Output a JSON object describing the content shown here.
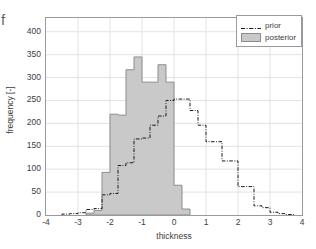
{
  "figure": {
    "stray_glyph": "f",
    "background_color": "#ffffff",
    "frame_color": "#9a9a9a",
    "grid_color": "#e3e3e3"
  },
  "legend": {
    "position": "top-right",
    "entries": [
      {
        "label": "prior",
        "key": "dashdot-line",
        "color": "#1a1a1a"
      },
      {
        "label": "posterior",
        "key": "filled-patch",
        "color": "#c9c9c9"
      }
    ]
  },
  "chart_data": {
    "type": "bar",
    "title": "",
    "subtitle": "",
    "xlabel": "thickness",
    "ylabel": "frequency [-]",
    "xlim": [
      -4,
      4
    ],
    "ylim": [
      0,
      430
    ],
    "xticks": [
      -4,
      -3,
      -2,
      -1,
      0,
      1,
      2,
      3,
      4
    ],
    "xticklabels": [
      "-4",
      "-3",
      "-2",
      "-1",
      "0",
      "1",
      "2",
      "3",
      "4"
    ],
    "yticks": [
      0,
      50,
      100,
      150,
      200,
      250,
      300,
      350,
      400
    ],
    "yticklabels": [
      "0",
      "50",
      "100",
      "150",
      "200",
      "250",
      "300",
      "350",
      "400"
    ],
    "grid": true,
    "legend_position": "upper right",
    "annotations": [],
    "series": [
      {
        "name": "posterior",
        "type": "histogram",
        "draw": "filled-bars",
        "fill_color": "#c9c9c9",
        "edge_color": "#8d8d8d",
        "bin_width": 0.25,
        "bin_left_edges": [
          -2.75,
          -2.5,
          -2.25,
          -2.0,
          -1.75,
          -1.5,
          -1.25,
          -1.0,
          -0.75,
          -0.5,
          -0.25,
          0.0,
          0.25
        ],
        "values": [
          4,
          10,
          93,
          220,
          218,
          317,
          345,
          290,
          290,
          328,
          290,
          65,
          13
        ]
      },
      {
        "name": "prior",
        "type": "histogram",
        "draw": "dashdot-step-line",
        "line_color": "#1a1a1a",
        "line_style": "dash-dot",
        "line_width": 1,
        "bin_width": 0.25,
        "bin_left_edges": [
          -3.5,
          -3.25,
          -3.0,
          -2.75,
          -2.5,
          -2.25,
          -2.0,
          -1.75,
          -1.5,
          -1.25,
          -1.0,
          -0.75,
          -0.5,
          -0.25,
          0.0,
          0.25,
          0.5,
          0.75,
          1.0,
          1.25,
          1.5,
          1.75,
          2.0,
          2.25,
          2.5,
          2.75,
          3.0,
          3.25,
          3.5
        ],
        "values": [
          2,
          3,
          5,
          12,
          14,
          44,
          47,
          108,
          114,
          166,
          168,
          196,
          216,
          250,
          253,
          253,
          228,
          196,
          160,
          160,
          118,
          118,
          62,
          62,
          20,
          16,
          6,
          3,
          1
        ]
      }
    ]
  }
}
